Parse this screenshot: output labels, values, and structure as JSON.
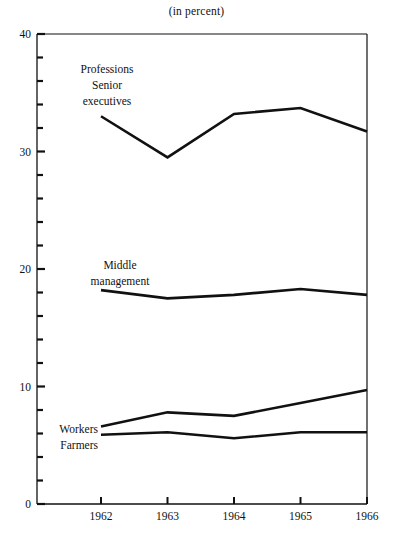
{
  "chart": {
    "title": "(in percent)",
    "axis": {
      "y_major_ticks": [
        "0",
        "10",
        "20",
        "30",
        "40"
      ],
      "x_ticks": [
        "1962",
        "1963",
        "1964",
        "1965",
        "1966"
      ]
    }
  },
  "labels": {
    "professions_line1": "Professions",
    "professions_line2": "Senior",
    "professions_line3": "executives",
    "middle_line1": "Middle",
    "middle_line2": "management",
    "workers": "Workers",
    "farmers": "Farmers"
  },
  "chart_data": {
    "type": "line",
    "title": "(in percent)",
    "xlabel": "",
    "ylabel": "",
    "x": [
      1962,
      1963,
      1964,
      1965,
      1966
    ],
    "categories": [
      "1962",
      "1963",
      "1964",
      "1965",
      "1966"
    ],
    "ylim": [
      0,
      40
    ],
    "y_major_tick_values": [
      0,
      10,
      20,
      30,
      40
    ],
    "y_minor_tick_interval": 2,
    "grid": false,
    "legend": "inline-labels",
    "series": [
      {
        "name": "Professions Senior executives",
        "values": [
          33.0,
          29.5,
          33.2,
          33.7,
          31.7
        ]
      },
      {
        "name": "Middle management",
        "values": [
          18.2,
          17.5,
          17.8,
          18.3,
          17.8
        ]
      },
      {
        "name": "Workers",
        "values": [
          6.6,
          7.8,
          7.5,
          8.6,
          9.7
        ]
      },
      {
        "name": "Farmers",
        "values": [
          5.9,
          6.1,
          5.6,
          6.1,
          6.1
        ]
      }
    ]
  }
}
